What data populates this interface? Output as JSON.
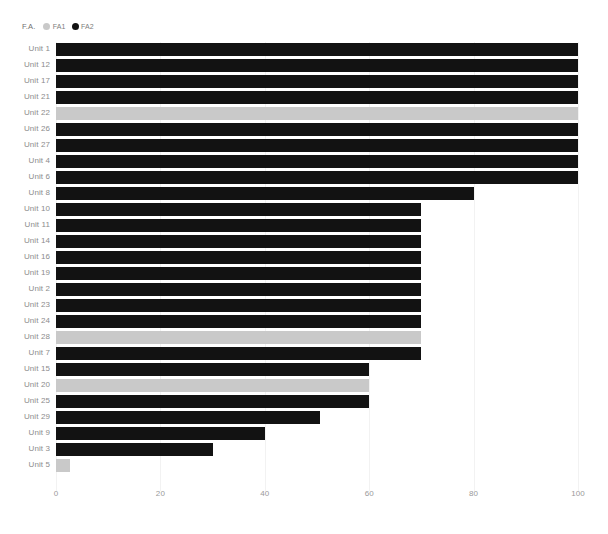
{
  "legend": {
    "title": "F.A.",
    "items": [
      {
        "label": "FA1",
        "color": "#c9c9c9"
      },
      {
        "label": "FA2",
        "color": "#121212"
      }
    ]
  },
  "chart_data": {
    "type": "bar",
    "orientation": "horizontal",
    "title": "",
    "xlabel": "",
    "ylabel": "",
    "xlim": [
      0,
      100
    ],
    "xticks": [
      0,
      20,
      40,
      60,
      80,
      100
    ],
    "xticklabels": [
      "0",
      "20",
      "40",
      "60",
      "80",
      "100"
    ],
    "grid": true,
    "legend_position": "top-left",
    "series": [
      {
        "name": "FA1",
        "color": "#c9c9c9"
      },
      {
        "name": "FA2",
        "color": "#121212"
      }
    ],
    "categories": [
      "Unit 1",
      "Unit 12",
      "Unit 17",
      "Unit 21",
      "Unit 22",
      "Unit 26",
      "Unit 27",
      "Unit 4",
      "Unit 6",
      "Unit 8",
      "Unit 10",
      "Unit 11",
      "Unit 14",
      "Unit 16",
      "Unit 19",
      "Unit 2",
      "Unit 23",
      "Unit 24",
      "Unit 28",
      "Unit 7",
      "Unit 15",
      "Unit 20",
      "Unit 25",
      "Unit 29",
      "Unit 9",
      "Unit 3",
      "Unit 5"
    ],
    "values": [
      100,
      100,
      100,
      100,
      100,
      100,
      100,
      100,
      100,
      80,
      70,
      70,
      70,
      70,
      70,
      70,
      70,
      70,
      70,
      70,
      60,
      60,
      60,
      50.5,
      40,
      30,
      2.7
    ],
    "group": [
      "FA2",
      "FA2",
      "FA2",
      "FA2",
      "FA1",
      "FA2",
      "FA2",
      "FA2",
      "FA2",
      "FA2",
      "FA2",
      "FA2",
      "FA2",
      "FA2",
      "FA2",
      "FA2",
      "FA2",
      "FA2",
      "FA1",
      "FA2",
      "FA2",
      "FA1",
      "FA2",
      "FA2",
      "FA2",
      "FA2",
      "FA1"
    ]
  }
}
